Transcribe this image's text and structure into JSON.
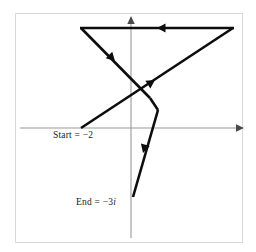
{
  "figure": {
    "background_color": "#ffffff",
    "frame": {
      "border_color": "#d8d8d8",
      "x": 15,
      "y": 13,
      "width": 228,
      "height": 230
    },
    "axes": {
      "color": "#9a9a9a",
      "origin": {
        "x": 131,
        "y": 128
      },
      "horizontal": {
        "x1": 20,
        "y1": 128,
        "x2": 244,
        "y2": 128,
        "arrow_at": "right"
      },
      "vertical": {
        "x1": 131,
        "y1": 238,
        "x2": 131,
        "y2": 16,
        "arrow_at": "top"
      }
    },
    "path": {
      "stroke_color": "#0d0d0d",
      "stroke_width": 2.6,
      "start_point": {
        "x": 81,
        "y": 128
      },
      "end_point": {
        "x": 133,
        "y": 197
      },
      "vertices": [
        {
          "x": 81,
          "y": 128
        },
        {
          "x": 233,
          "y": 28
        },
        {
          "x": 81,
          "y": 28
        },
        {
          "x": 150,
          "y": 98
        },
        {
          "x": 158,
          "y": 110
        },
        {
          "x": 133,
          "y": 197
        }
      ],
      "direction_markers": [
        {
          "name": "marker-up-right",
          "x": 153,
          "y": 82,
          "angle": -33
        },
        {
          "name": "marker-left",
          "x": 159,
          "y": 28,
          "angle": 180
        },
        {
          "name": "marker-down-right",
          "x": 113,
          "y": 60,
          "angle": 45
        },
        {
          "name": "marker-down-left",
          "x": 144,
          "y": 151,
          "angle": 106
        }
      ]
    },
    "labels": {
      "start": {
        "name": "start-label",
        "prefix": "Start = ",
        "value": "−2",
        "full_text": "Start = −2"
      },
      "end": {
        "name": "end-label",
        "prefix": "End = ",
        "value": "−3",
        "unit": "i",
        "full_text": "End = −3i"
      }
    }
  }
}
